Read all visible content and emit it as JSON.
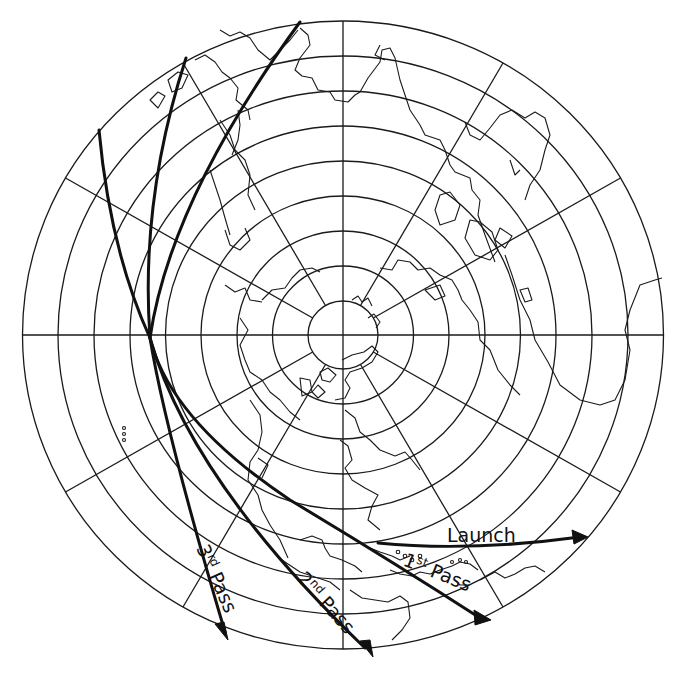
{
  "figure": {
    "type": "polar-projection-map",
    "projection_center": "north-pole",
    "latitude_circles": 9,
    "meridian_spacing_deg": 30,
    "colors": {
      "ink": "#111111",
      "paper": "#ffffff"
    }
  },
  "tracks": [
    {
      "id": "launch",
      "label": "Launch",
      "sup": ""
    },
    {
      "id": "pass1",
      "label_num": "1",
      "sup": "st",
      "label_word": "Pass"
    },
    {
      "id": "pass2",
      "label_num": "2",
      "sup": "nd",
      "label_word": "Pass"
    },
    {
      "id": "pass3",
      "label_num": "3",
      "sup": "rd",
      "label_word": "Pass"
    }
  ],
  "labels": {
    "launch": "Launch",
    "pass1_num": "1",
    "pass1_sup": "st",
    "pass1_word": "Pass",
    "pass2_num": "2",
    "pass2_sup": "nd",
    "pass2_word": "Pass",
    "pass3_num": "3",
    "pass3_sup": "rd",
    "pass3_word": "Pass"
  }
}
